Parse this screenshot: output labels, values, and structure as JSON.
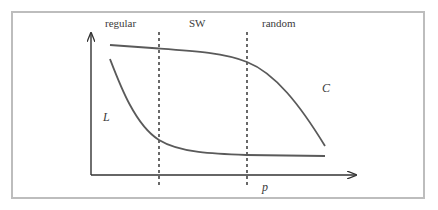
{
  "diagram": {
    "regions": [
      {
        "label": "regular"
      },
      {
        "label": "SW"
      },
      {
        "label": "random"
      }
    ],
    "curves": [
      {
        "name": "C",
        "label": "C"
      },
      {
        "name": "L",
        "label": "L"
      }
    ],
    "x_axis_label": "p",
    "colors": {
      "curve": "#555555",
      "axis": "#333333",
      "frame": "#bdbdbd",
      "text": "#3a3a3a"
    }
  }
}
